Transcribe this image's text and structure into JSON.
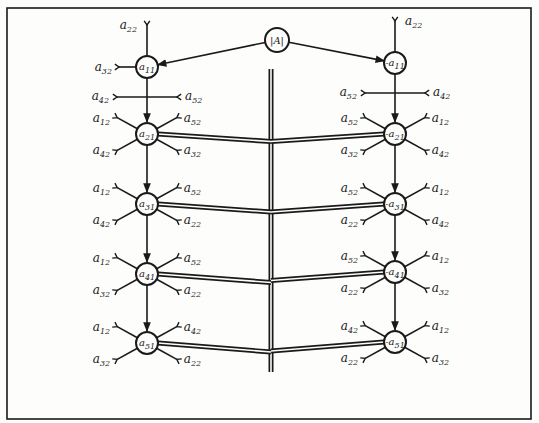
{
  "diagram": {
    "type": "network-schematic",
    "root": {
      "label": "|A|",
      "x": 277,
      "y": 40
    },
    "columns": [
      {
        "side": "left",
        "nodes": [
          {
            "label": "a11",
            "x": 147,
            "y": 67,
            "inputs": [
              {
                "label": "a22",
                "from": "top"
              },
              {
                "label": "a32",
                "from": "left"
              }
            ]
          },
          {
            "label": "a21",
            "x": 147,
            "y": 134,
            "inputs": [
              {
                "label": "a12",
                "pos": "upper-left"
              },
              {
                "label": "a52",
                "pos": "upper-right"
              },
              {
                "label": "a42",
                "pos": "lower-left"
              },
              {
                "label": "a32",
                "pos": "lower-right"
              }
            ]
          },
          {
            "label": "a31",
            "x": 147,
            "y": 204,
            "inputs": [
              {
                "label": "a12",
                "pos": "upper-left"
              },
              {
                "label": "a52",
                "pos": "upper-right"
              },
              {
                "label": "a42",
                "pos": "lower-left"
              },
              {
                "label": "a22",
                "pos": "lower-right"
              }
            ]
          },
          {
            "label": "a41",
            "x": 147,
            "y": 274,
            "inputs": [
              {
                "label": "a12",
                "pos": "upper-left"
              },
              {
                "label": "a52",
                "pos": "upper-right"
              },
              {
                "label": "a32",
                "pos": "lower-left"
              },
              {
                "label": "a22",
                "pos": "lower-right"
              }
            ]
          },
          {
            "label": "a51",
            "x": 147,
            "y": 343,
            "inputs": [
              {
                "label": "a12",
                "pos": "upper-left"
              },
              {
                "label": "a42",
                "pos": "upper-right"
              },
              {
                "label": "a32",
                "pos": "lower-left"
              },
              {
                "label": "a22",
                "pos": "lower-right"
              }
            ]
          }
        ],
        "crossbar": {
          "left": "a42",
          "right": "a52"
        }
      },
      {
        "side": "right",
        "nodes": [
          {
            "label": "-a11",
            "x": 395,
            "y": 63,
            "inputs": [
              {
                "label": "a22",
                "from": "top"
              }
            ]
          },
          {
            "label": "-a21",
            "x": 395,
            "y": 134,
            "inputs": [
              {
                "label": "a52",
                "pos": "upper-left"
              },
              {
                "label": "a12",
                "pos": "upper-right"
              },
              {
                "label": "a32",
                "pos": "lower-left"
              },
              {
                "label": "a42",
                "pos": "lower-right"
              }
            ]
          },
          {
            "label": "-a31",
            "x": 395,
            "y": 204,
            "inputs": [
              {
                "label": "a52",
                "pos": "upper-left"
              },
              {
                "label": "a12",
                "pos": "upper-right"
              },
              {
                "label": "a22",
                "pos": "lower-left"
              },
              {
                "label": "a42",
                "pos": "lower-right"
              }
            ]
          },
          {
            "label": "-a41",
            "x": 395,
            "y": 272,
            "inputs": [
              {
                "label": "a52",
                "pos": "upper-left"
              },
              {
                "label": "a12",
                "pos": "upper-right"
              },
              {
                "label": "a22",
                "pos": "lower-left"
              },
              {
                "label": "a32",
                "pos": "lower-right"
              }
            ]
          },
          {
            "label": "-a51",
            "x": 395,
            "y": 342,
            "inputs": [
              {
                "label": "a42",
                "pos": "upper-left"
              },
              {
                "label": "a12",
                "pos": "upper-right"
              },
              {
                "label": "a22",
                "pos": "lower-left"
              },
              {
                "label": "a32",
                "pos": "lower-right"
              }
            ]
          }
        ],
        "crossbar": {
          "left": "a52",
          "right": "a42"
        }
      }
    ],
    "bus": {
      "x": 271,
      "y_top": 69,
      "y_bottom": 372,
      "style": "double-line"
    }
  }
}
